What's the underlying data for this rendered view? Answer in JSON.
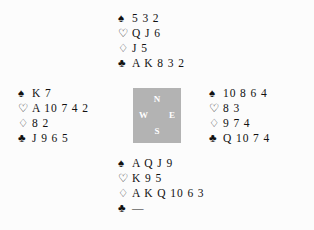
{
  "diagram": {
    "type": "bridge-deal",
    "background_color": "#fcfcfc",
    "text_color": "#111111"
  },
  "compass": {
    "background_color": "#b3b3b3",
    "label_color": "#ffffff",
    "north": "N",
    "west": "W",
    "east": "E",
    "south": "S"
  },
  "suits": {
    "spade_symbol": "♠",
    "heart_symbol": "♡",
    "diamond_symbol": "♢",
    "club_symbol": "♣",
    "void_mark": "—"
  },
  "hands": {
    "north": {
      "position": "North",
      "spades": "5 3 2",
      "hearts": "Q J 6",
      "diamonds": "J 5",
      "clubs": "A K 8 3 2"
    },
    "west": {
      "position": "West",
      "spades": "K 7",
      "hearts": "A 10 7 4 2",
      "diamonds": "8 2",
      "clubs": "J 9 6 5"
    },
    "east": {
      "position": "East",
      "spades": "10 8 6 4",
      "hearts": "8 3",
      "diamonds": "9 7 4",
      "clubs": "Q 10 7 4"
    },
    "south": {
      "position": "South",
      "spades": "A Q J 9",
      "hearts": "K 9 5",
      "diamonds": "A K Q 10 6 3",
      "clubs": "—"
    }
  }
}
